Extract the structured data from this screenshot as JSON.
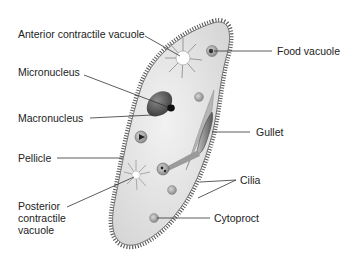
{
  "diagram": {
    "labels": {
      "anterior_contractile_vacuole": "Anterior contractile vacuole",
      "food_vacuole": "Food vacuole",
      "micronucleus": "Micronucleus",
      "macronucleus": "Macronucleus",
      "gullet": "Gullet",
      "pellicle": "Pellicle",
      "cilia": "Cilia",
      "posterior_contractile_vacuole_line1": "Posterior",
      "posterior_contractile_vacuole_line2": "contractile",
      "posterior_contractile_vacuole_line3": "vacuole",
      "cytoproct": "Cytoproct"
    },
    "colors": {
      "cytoplasm": "#e4e4e4",
      "cilia": "#555555",
      "macronucleus": "#555555",
      "leader_line": "#333333",
      "text": "#222222"
    }
  }
}
